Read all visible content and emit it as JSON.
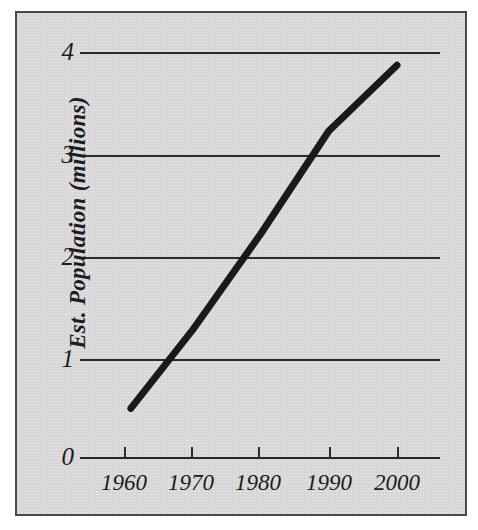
{
  "chart_data": {
    "type": "line",
    "title": "",
    "subtitle": "",
    "xlabel": "",
    "ylabel": "Est. Population (millions)",
    "x": [
      1961,
      1970,
      1980,
      1990,
      2000
    ],
    "values": [
      0.48,
      1.25,
      2.2,
      3.22,
      3.87
    ],
    "series": [
      {
        "name": "Est. Population",
        "x": [
          1961,
          1970,
          1980,
          1990,
          2000
        ],
        "values": [
          0.48,
          1.25,
          2.2,
          3.22,
          3.87
        ]
      }
    ],
    "xtick_labels": [
      "1960",
      "1970",
      "1980",
      "1990",
      "2000"
    ],
    "xtick_values": [
      1960,
      1970,
      1980,
      1990,
      2000
    ],
    "ytick_labels": [
      "0",
      "1",
      "2",
      "3",
      "4"
    ],
    "ytick_values": [
      0,
      1,
      2,
      3,
      4
    ],
    "xlim": [
      1955,
      2005
    ],
    "ylim": [
      0,
      4
    ],
    "grid": "horizontal",
    "legend": "none",
    "annotations": [],
    "colors": {
      "line": "#1a1a1a",
      "grid": "#2b2b2b",
      "axis": "#262626",
      "text": "#1c1c1c",
      "panel_background": "#d7d7d7",
      "panel_border": "#4a4a4a",
      "page_background": "#ffffff"
    },
    "line_width_px": 7
  },
  "axes": {
    "y_ticks": [
      {
        "label": "4",
        "value": 4
      },
      {
        "label": "3",
        "value": 3
      },
      {
        "label": "2",
        "value": 2
      },
      {
        "label": "1",
        "value": 1
      },
      {
        "label": "0",
        "value": 0
      }
    ],
    "x_ticks": [
      {
        "label": "1960",
        "value": 1960
      },
      {
        "label": "1970",
        "value": 1970
      },
      {
        "label": "1980",
        "value": 1980
      },
      {
        "label": "1990",
        "value": 1990
      },
      {
        "label": "2000",
        "value": 2000
      }
    ],
    "y_axis_title": "Est. Population (millions)"
  }
}
